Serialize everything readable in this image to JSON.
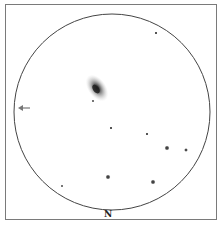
{
  "sketch": {
    "title": "Eyepiece field sketch",
    "orientation_label": "N",
    "galaxy": {
      "name": "galaxy",
      "core_color": "#222222",
      "halo_color": "#9a9a9a"
    },
    "arrow": {
      "name": "drift-arrow",
      "direction": "left"
    },
    "stars": [
      {
        "id": "star-1",
        "x": 156,
        "y": 33,
        "magnitude": "faint"
      },
      {
        "id": "star-2",
        "x": 93,
        "y": 101,
        "magnitude": "very-faint"
      },
      {
        "id": "star-3",
        "x": 111,
        "y": 128,
        "magnitude": "faint"
      },
      {
        "id": "star-4",
        "x": 147,
        "y": 134,
        "magnitude": "faint"
      },
      {
        "id": "star-5",
        "x": 167,
        "y": 148,
        "magnitude": "bright"
      },
      {
        "id": "star-6",
        "x": 186,
        "y": 150,
        "magnitude": "medium"
      },
      {
        "id": "star-7",
        "x": 108,
        "y": 177,
        "magnitude": "bright"
      },
      {
        "id": "star-8",
        "x": 153,
        "y": 182,
        "magnitude": "bright"
      },
      {
        "id": "star-9",
        "x": 62,
        "y": 186,
        "magnitude": "very-faint"
      }
    ],
    "colors": {
      "circle": "#444444",
      "star": "#333333"
    }
  }
}
